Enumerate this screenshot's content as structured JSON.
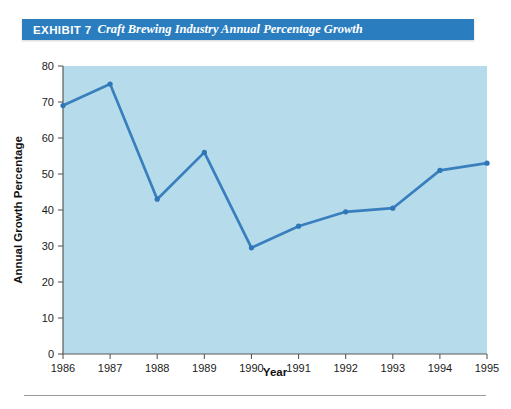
{
  "exhibit": {
    "label": "EXHIBIT 7",
    "title": "Craft Brewing Industry Annual Percentage Growth",
    "banner_color": "#2a7ec0"
  },
  "chart_data": {
    "type": "line",
    "title": "Craft Brewing Industry Annual Percentage Growth",
    "xlabel": "Year",
    "ylabel": "Annual Growth Percentage",
    "categories": [
      "1986",
      "1987",
      "1988",
      "1989",
      "1990",
      "1991",
      "1992",
      "1993",
      "1994",
      "1995"
    ],
    "values": [
      69,
      75,
      43,
      56,
      29.5,
      35.5,
      39.5,
      40.5,
      51,
      53
    ],
    "xlim": [
      "1986",
      "1995"
    ],
    "ylim": [
      0,
      80
    ],
    "ytick_labels": [
      "80",
      "70",
      "60",
      "50",
      "40",
      "30",
      "20",
      "10",
      "0"
    ],
    "ytick_values": [
      80,
      70,
      60,
      50,
      40,
      30,
      20,
      10,
      0
    ],
    "xtick_labels": [
      "1986",
      "1987",
      "1988",
      "1989",
      "1990",
      "1991",
      "1992",
      "1993",
      "1994",
      "1995"
    ],
    "grid": false,
    "legend": null,
    "plot_background_color": "#b6dcec",
    "line_color": "#3a7fbd",
    "marker_color": "#2f76b6"
  }
}
